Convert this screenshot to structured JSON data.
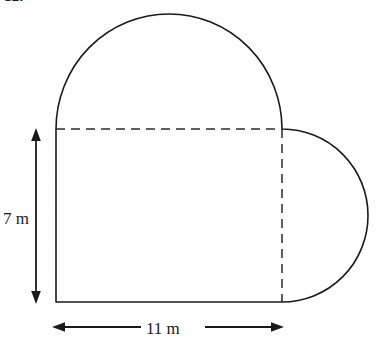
{
  "problem": {
    "number": "12."
  },
  "figure": {
    "name": "composite-heart-shape",
    "stroke_color": "#1a1a1a",
    "dash_color": "#2b2b2b",
    "fill_color": "none",
    "stroke_width": 1.6
  },
  "dimensions": {
    "height_label": "7 m",
    "width_label": "11 m",
    "height_value": 7,
    "width_value": 11,
    "units": "m"
  },
  "geometry": {
    "square_left_x": 56,
    "square_right_x": 282,
    "square_top_y": 129,
    "square_bottom_y": 302,
    "top_semicircle_apex_y": 14,
    "right_semicircle_right_x": 368,
    "right_semicircle_center_y": 215,
    "vertical_arrow_x": 36,
    "vertical_arrow_top_y": 131,
    "vertical_arrow_bottom_y": 301,
    "horizontal_arrow_y": 327,
    "horizontal_arrow_left_x": 53,
    "horizontal_arrow_right_x": 283
  }
}
